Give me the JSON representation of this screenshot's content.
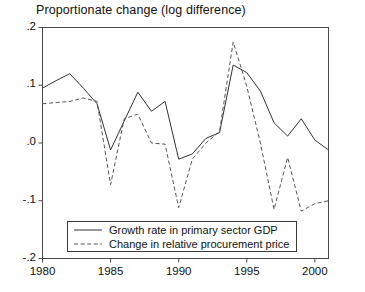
{
  "chart_data": {
    "type": "line",
    "title": "Proportionate change (log difference)",
    "xlabel": "",
    "ylabel": "",
    "xlim": [
      1980,
      2001
    ],
    "ylim": [
      -0.2,
      0.2
    ],
    "grid": false,
    "legend_position": "bottom-center",
    "x_ticks": [
      "1980",
      "1985",
      "1990",
      "1995",
      "2000"
    ],
    "x_tick_values": [
      1980,
      1985,
      1990,
      1995,
      2000
    ],
    "y_ticks": [
      ".2",
      ".1",
      ".0",
      "-.1",
      "-.2"
    ],
    "y_tick_values": [
      0.2,
      0.1,
      0.0,
      -0.1,
      -0.2
    ],
    "x": [
      1980,
      1981,
      1982,
      1983,
      1984,
      1985,
      1986,
      1987,
      1988,
      1989,
      1990,
      1991,
      1992,
      1993,
      1994,
      1995,
      1996,
      1997,
      1998,
      1999,
      2000,
      2001
    ],
    "series": [
      {
        "name": "Growth rate in primary sector GDP",
        "style": "solid",
        "color": "#333333",
        "values": [
          0.095,
          0.108,
          0.12,
          0.095,
          0.068,
          -0.012,
          0.038,
          0.088,
          0.055,
          0.072,
          -0.028,
          -0.019,
          0.008,
          0.018,
          0.135,
          0.122,
          0.09,
          0.035,
          0.012,
          0.042,
          0.005,
          -0.012
        ]
      },
      {
        "name": "Change in relative procurement price",
        "style": "dashed",
        "color": "#555555",
        "values": [
          0.068,
          0.07,
          0.072,
          0.078,
          0.072,
          -0.072,
          0.042,
          0.05,
          0.0,
          -0.002,
          -0.112,
          -0.028,
          0.0,
          0.02,
          0.175,
          0.098,
          0.0,
          -0.115,
          -0.025,
          -0.118,
          -0.105,
          -0.1
        ]
      }
    ]
  },
  "legend": {
    "items": [
      {
        "label": "Growth rate in primary sector GDP",
        "style": "solid"
      },
      {
        "label": "Change in relative procurement price",
        "style": "dashed"
      }
    ]
  }
}
